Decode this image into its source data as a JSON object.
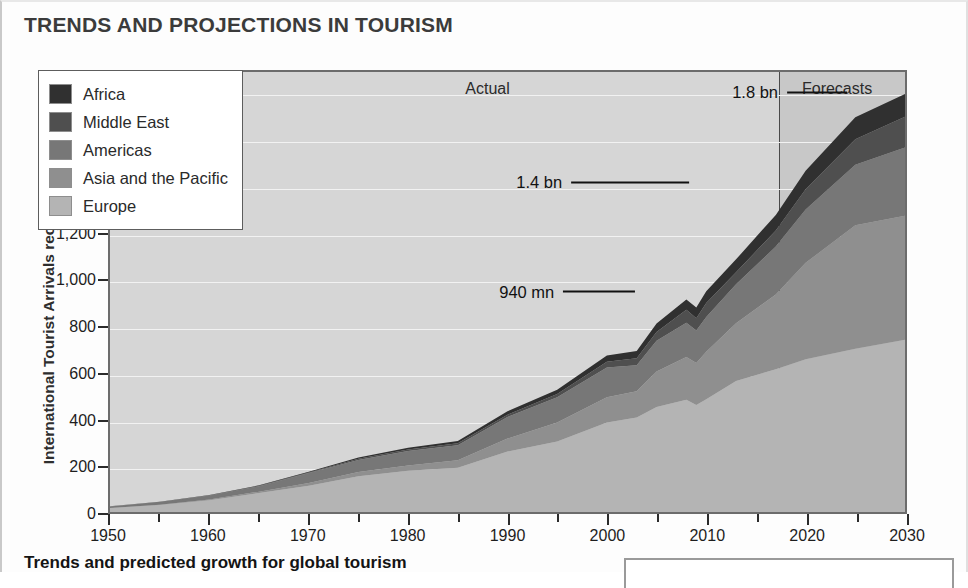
{
  "page": {
    "title": "TRENDS AND PROJECTIONS IN TOURISM",
    "caption": "Trends and predicted growth for global tourism"
  },
  "chart_data": {
    "type": "area",
    "stacked": true,
    "title": "TRENDS AND PROJECTIONS IN TOURISM",
    "xlabel": "",
    "ylabel": "International Tourist Arrivals received (millions)",
    "xlim": [
      1950,
      2030
    ],
    "ylim": [
      0,
      1900
    ],
    "ytick_labels": [
      "0",
      "200",
      "400",
      "600",
      "800",
      "1,000",
      "1,200",
      "1,400",
      "1,600",
      "1,800"
    ],
    "ytick_values": [
      0,
      200,
      400,
      600,
      800,
      1000,
      1200,
      1400,
      1600,
      1800
    ],
    "xtick_labels": [
      "1950",
      "1960",
      "1970",
      "1980",
      "1990",
      "2000",
      "2010",
      "2020",
      "2030"
    ],
    "xtick_values": [
      1950,
      1960,
      1970,
      1980,
      1990,
      2000,
      2010,
      2020,
      2030
    ],
    "minor_xtick_values": [
      1955,
      1965,
      1975,
      1985,
      1995,
      2005,
      2015,
      2025
    ],
    "grid": true,
    "grid_color": "#f2f2f2",
    "plot_background": "#d6d6d6",
    "forecast_background": "#c8c8c8",
    "legend_position": "upper-left",
    "forecast_start_year": 2017,
    "x": [
      1950,
      1955,
      1960,
      1965,
      1970,
      1975,
      1980,
      1985,
      1990,
      1995,
      2000,
      2003,
      2005,
      2008,
      2009,
      2010,
      2013,
      2017,
      2020,
      2025,
      2030
    ],
    "series": [
      {
        "name": "Europe",
        "color": "#b4b4b4",
        "values": [
          17,
          30,
          51,
          82,
          113,
          154,
          178,
          191,
          261,
          304,
          386,
          408,
          453,
          485,
          462,
          487,
          566,
          616,
          660,
          705,
          744
        ]
      },
      {
        "name": "Asia and the Pacific",
        "color": "#8f8f8f",
        "values": [
          0.2,
          1,
          3,
          6,
          12,
          19,
          23,
          32,
          56,
          82,
          110,
          113,
          154,
          184,
          181,
          205,
          249,
          323,
          416,
          533,
          535
        ]
      },
      {
        "name": "Americas",
        "color": "#777777",
        "values": [
          7,
          12,
          17,
          23,
          43,
          51,
          62,
          65,
          93,
          109,
          128,
          113,
          133,
          148,
          141,
          150,
          168,
          207,
          230,
          262,
          295
        ]
      },
      {
        "name": "Middle East",
        "color": "#4f4f4f",
        "values": [
          0.2,
          0.6,
          1,
          2,
          3,
          6,
          7,
          9,
          10,
          14,
          25,
          30,
          37,
          56,
          53,
          61,
          52,
          70,
          88,
          110,
          133
        ]
      },
      {
        "name": "Africa",
        "color": "#303030",
        "values": [
          0.5,
          1,
          1,
          2,
          3,
          5,
          7,
          10,
          15,
          19,
          27,
          31,
          37,
          45,
          46,
          50,
          56,
          67,
          80,
          95,
          98
        ]
      }
    ],
    "annotations": [
      {
        "label": "1.8 bn",
        "year": 2030,
        "value": 1805
      },
      {
        "label": "1.4 bn",
        "year": 2020,
        "value": 1420
      },
      {
        "label": "940 mn",
        "year": 2010,
        "value": 952
      }
    ],
    "region_labels": [
      {
        "label": "Actual",
        "year": 1988
      },
      {
        "label": "Forecasts",
        "year": 2023
      }
    ]
  },
  "legend": {
    "items": [
      {
        "label": "Africa",
        "color": "#303030"
      },
      {
        "label": "Middle East",
        "color": "#4f4f4f"
      },
      {
        "label": "Americas",
        "color": "#777777"
      },
      {
        "label": "Asia and the Pacific",
        "color": "#8f8f8f"
      },
      {
        "label": "Europe",
        "color": "#b4b4b4"
      }
    ]
  }
}
